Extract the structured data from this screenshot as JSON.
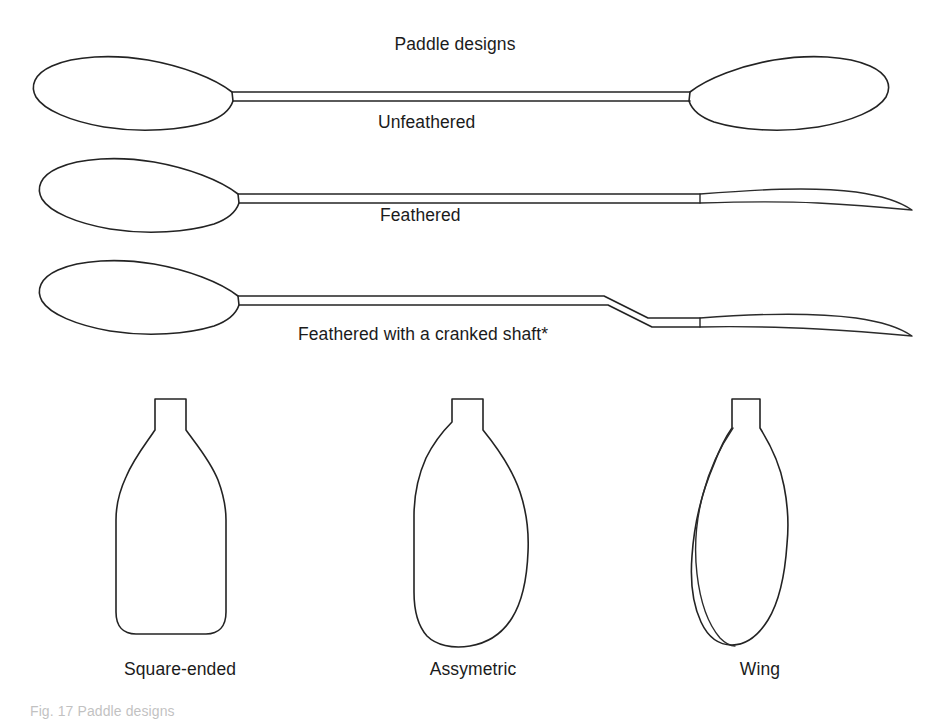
{
  "figure": {
    "title": "Paddle designs",
    "background_color": "#ffffff",
    "line_color": "#232323",
    "text_color": "#1b1b1b",
    "caption": "Fig. 17 Paddle designs",
    "paddles": [
      {
        "label": "Unfeathered",
        "label_x": 378,
        "label_y": 114,
        "description": "Two blades in the same plane, both shown flat-on"
      },
      {
        "label": "Feathered",
        "label_x": 380,
        "label_y": 207,
        "description": "Left blade flat-on, right blade rotated and seen edge-on"
      },
      {
        "label": "Feathered with a cranked shaft*",
        "label_x": 298,
        "label_y": 326,
        "description": "Feathered blades with a bent or cranked shaft"
      }
    ],
    "blades": [
      {
        "label": "Square-ended",
        "label_x": 180,
        "label_y": 661,
        "description": "Bottle shaped blade with parallel sides and a squared tip"
      },
      {
        "label": "Assymetric",
        "label_x": 473,
        "label_y": 661,
        "description": "Curved blade with unequal left and right halves"
      },
      {
        "label": "Wing",
        "label_x": 760,
        "label_y": 661,
        "description": "Narrow scooped blade with a curved wing ridge"
      }
    ]
  }
}
